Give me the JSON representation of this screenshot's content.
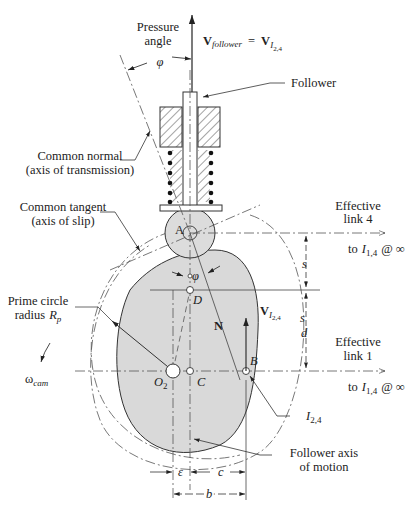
{
  "diagram": {
    "type": "cam-follower kinematic diagram",
    "colors": {
      "cam_fill": "#d9d9d9",
      "roller_fill": "#dcdcdc",
      "line": "#333333",
      "background": "#ffffff"
    },
    "labels": {
      "pressure_angle_line1": "Pressure",
      "pressure_angle_line2": "angle",
      "phi_top": "φ",
      "phi_mid": "φ",
      "v_follower_V": "V",
      "v_follower_sub": "follower",
      "equals": "=",
      "v_i24_V": "V",
      "v_i24_I": "I",
      "v_i24_sub": "2,4",
      "follower": "Follower",
      "common_normal_line1": "Common normal",
      "common_normal_line2": "(axis of transmission)",
      "common_tangent_line1": "Common tangent",
      "common_tangent_line2": "(axis of slip)",
      "effective_link4_line1": "Effective",
      "effective_link4_line2": "link  4",
      "to_i14_top_to": "to",
      "to_i14_top_I": "I",
      "to_i14_top_sub": "1,4",
      "to_i14_top_inf": "@ ∞",
      "point_A": "A",
      "point_D": "D",
      "point_B": "B",
      "point_C": "C",
      "point_O": "O",
      "point_O_sub": "2",
      "N": "N",
      "s": "s",
      "d": "d",
      "vel_B_V": "V",
      "vel_B_I": "I",
      "vel_B_sub": "2,4",
      "prime_circle_line1": "Prime circle",
      "prime_circle_line2": "radius",
      "prime_circle_R": "R",
      "prime_circle_sub": "p",
      "omega": "ω",
      "omega_sub": "cam",
      "effective_link1_line1": "Effective",
      "effective_link1_line2": "link  1",
      "to_i14_bot_to": "to",
      "to_i14_bot_I": "I",
      "to_i14_bot_sub": "1,4",
      "to_i14_bot_inf": "@ ∞",
      "i24_I": "I",
      "i24_sub": "2,4",
      "follower_axis_line1": "Follower axis",
      "follower_axis_line2": "of motion",
      "epsilon": "ε",
      "c": "c",
      "b": "b"
    }
  }
}
